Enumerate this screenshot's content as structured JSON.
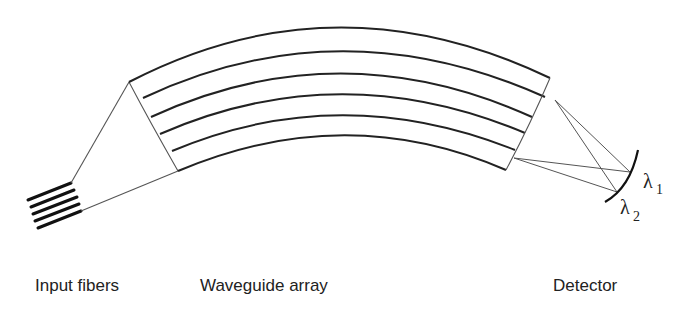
{
  "diagram": {
    "components": [
      {
        "id": "input-fibers",
        "label": "Input fibers"
      },
      {
        "id": "waveguide-array",
        "label": "Waveguide array",
        "waveguide_count": 5
      },
      {
        "id": "detector",
        "label": "Detector"
      }
    ],
    "wavelengths": [
      {
        "symbol": "λ",
        "subscript": "1"
      },
      {
        "symbol": "λ",
        "subscript": "2"
      }
    ],
    "colors": {
      "line": "#222222",
      "thin_line": "#555555",
      "background": "#ffffff"
    }
  }
}
